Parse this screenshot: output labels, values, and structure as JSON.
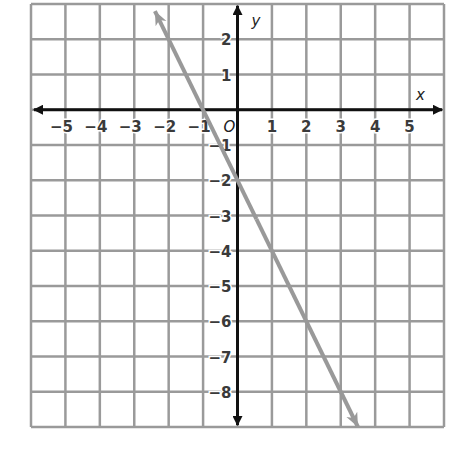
{
  "chart_data": {
    "type": "line",
    "title": "",
    "xlabel": "x",
    "ylabel": "y",
    "xlim": [
      -6,
      6
    ],
    "ylim": [
      -9,
      3
    ],
    "grid": true,
    "x_ticks": [
      -5,
      -4,
      -3,
      -2,
      -1,
      1,
      2,
      3,
      4,
      5
    ],
    "y_ticks": [
      2,
      1,
      -1,
      -2,
      -3,
      -4,
      -5,
      -6,
      -7,
      -8
    ],
    "origin_label": "O",
    "series": [
      {
        "name": "line",
        "equation": "y = -2x - 2",
        "slope": -2,
        "intercept": -2,
        "x": [
          -2.4,
          -1,
          0,
          1,
          2,
          3,
          3.5
        ],
        "y": [
          2.8,
          0,
          -2,
          -4,
          -6,
          -8,
          -9
        ],
        "color": "#999999",
        "arrows": "both"
      }
    ]
  },
  "colors": {
    "grid": "#9a9a9a",
    "axis": "#111111",
    "line": "#999999"
  }
}
